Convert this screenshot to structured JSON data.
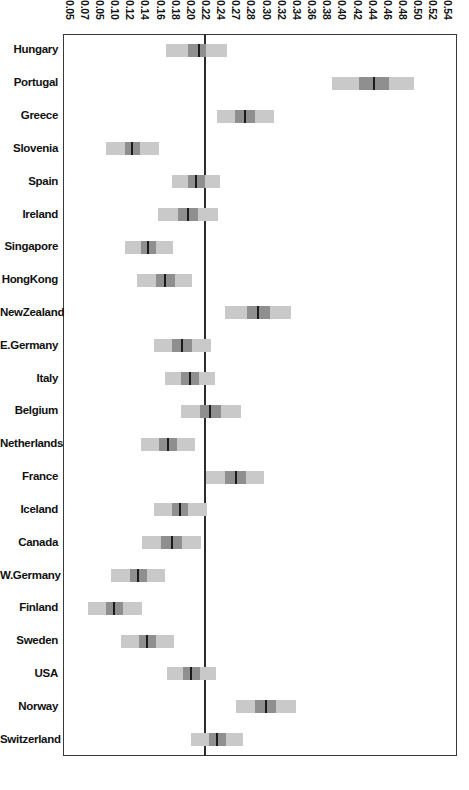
{
  "chart_data": {
    "type": "bar",
    "subtype": "forest-plot-confidence-intervals",
    "title": "",
    "xlabel": "",
    "ylabel": "",
    "orientation": "horizontal",
    "grid": false,
    "legend": null,
    "xlim": [
      0.05,
      0.54
    ],
    "reference_line": 0.22,
    "xticks": [
      "0.05",
      "0.07",
      "0.05",
      "0.10",
      "0.12",
      "0.14",
      "0.16",
      "0.18",
      "0.20",
      "0.22",
      "0.24",
      "0.27",
      "0.28",
      "0.30",
      "0.32",
      "0.34",
      "0.36",
      "0.38",
      "0.40",
      "0.42",
      "0.44",
      "0.46",
      "0.48",
      "0.50",
      "0.52",
      "0.54"
    ],
    "categories": [
      "Hungary",
      "Portugal",
      "Greece",
      "Slovenia",
      "Spain",
      "Ireland",
      "Singapore",
      "HongKong",
      "NewZealand",
      "E.Germany",
      "Italy",
      "Belgium",
      "Netherlands",
      "France",
      "Iceland",
      "Canada",
      "W.Germany",
      "Finland",
      "Sweden",
      "USA",
      "Norway",
      "Switzerland"
    ],
    "series": [
      {
        "name": "point estimate",
        "values": [
          0.219,
          0.437,
          0.276,
          0.136,
          0.216,
          0.206,
          0.156,
          0.177,
          0.293,
          0.198,
          0.208,
          0.233,
          0.181,
          0.265,
          0.196,
          0.185,
          0.143,
          0.114,
          0.155,
          0.209,
          0.302,
          0.242
        ]
      },
      {
        "name": "inner interval low",
        "values": [
          0.205,
          0.418,
          0.264,
          0.127,
          0.205,
          0.193,
          0.147,
          0.166,
          0.279,
          0.186,
          0.197,
          0.22,
          0.17,
          0.252,
          0.186,
          0.172,
          0.133,
          0.104,
          0.145,
          0.199,
          0.289,
          0.231
        ]
      },
      {
        "name": "inner interval high",
        "values": [
          0.228,
          0.455,
          0.289,
          0.146,
          0.226,
          0.218,
          0.166,
          0.189,
          0.307,
          0.211,
          0.219,
          0.247,
          0.192,
          0.277,
          0.206,
          0.198,
          0.154,
          0.125,
          0.166,
          0.22,
          0.315,
          0.253
        ]
      },
      {
        "name": "outer interval low",
        "values": [
          0.178,
          0.385,
          0.241,
          0.104,
          0.186,
          0.168,
          0.127,
          0.142,
          0.252,
          0.163,
          0.177,
          0.197,
          0.147,
          0.228,
          0.163,
          0.148,
          0.11,
          0.081,
          0.122,
          0.179,
          0.265,
          0.209
        ]
      },
      {
        "name": "outer interval high",
        "values": [
          0.254,
          0.487,
          0.313,
          0.169,
          0.245,
          0.243,
          0.187,
          0.211,
          0.334,
          0.234,
          0.239,
          0.271,
          0.214,
          0.3,
          0.229,
          0.222,
          0.177,
          0.148,
          0.188,
          0.24,
          0.34,
          0.274
        ]
      }
    ]
  },
  "axis": {
    "tick_count": 26
  },
  "colors": {
    "ci_outer": "#c9c9c9",
    "ci_inner": "#8f8f8f",
    "point_estimate": "#1a1a1a",
    "frame": "#3a3a3a",
    "reference_line": "#2b2b2b",
    "background": "#ffffff",
    "text": "#111111"
  }
}
